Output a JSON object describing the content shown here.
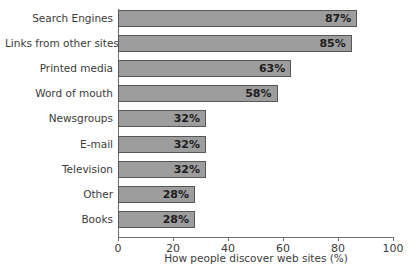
{
  "chart_data": {
    "type": "bar",
    "orientation": "horizontal",
    "title": "",
    "xlabel": "How people discover web sites (%)",
    "ylabel": "",
    "xlim": [
      0,
      100
    ],
    "xticks": [
      0,
      20,
      40,
      60,
      80,
      100
    ],
    "grid": false,
    "legend": null,
    "value_suffix": "%",
    "categories": [
      "Search Engines",
      "Links from other sites",
      "Printed media",
      "Word of mouth",
      "Newsgroups",
      "E-mail",
      "Television",
      "Other",
      "Books"
    ],
    "values": [
      87,
      85,
      63,
      58,
      32,
      32,
      32,
      28,
      28
    ],
    "value_labels": [
      "87%",
      "85%",
      "63%",
      "58%",
      "32%",
      "32%",
      "32%",
      "28%",
      "28%"
    ],
    "tick_labels": [
      "0",
      "20",
      "40",
      "60",
      "80",
      "100"
    ],
    "colors": {
      "bar_fill": "#9d9d9d",
      "bar_border": "#575757",
      "axis": "#6e6e6e",
      "text": "#3b3b3b",
      "value_text": "#1c1c1c",
      "background": "#ffffff"
    }
  }
}
